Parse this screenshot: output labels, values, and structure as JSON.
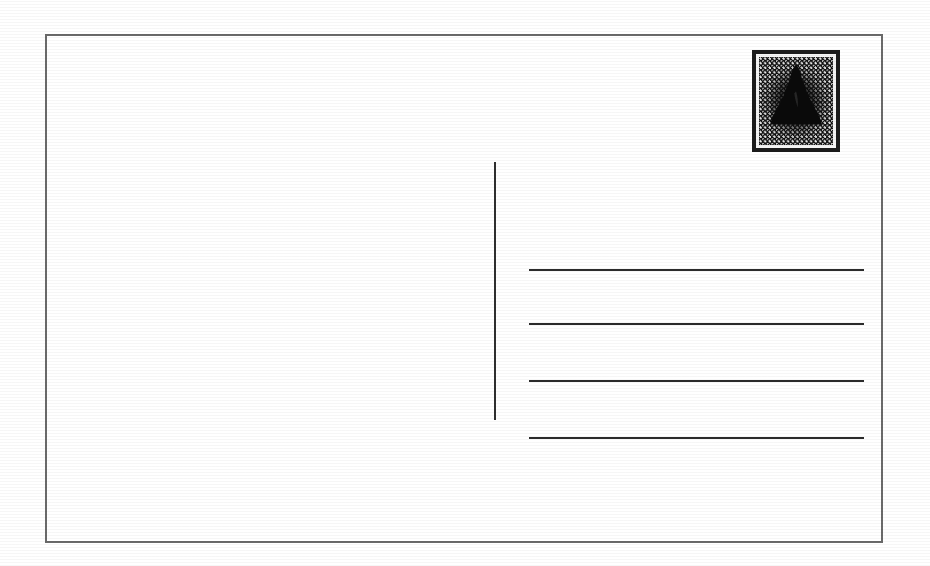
{
  "document": {
    "title": "Blank Postcard Back Template",
    "kind": "postcard-back",
    "orientation": "landscape",
    "background_color": "#ffffff",
    "ink_color": "#2a2a2a",
    "width_px": 930,
    "height_px": 566
  },
  "card": {
    "border_label": "Postcard outer border",
    "border_color": "#2a2a2a",
    "border_width_px": 2,
    "fill_color": "#ffffff",
    "left_px": 45,
    "top_px": 34,
    "width_px": 838,
    "height_px": 509
  },
  "divider": {
    "label": "Vertical divider between message area and address area",
    "color": "#2f2f2f",
    "x_px": 495,
    "top_px": 162,
    "bottom_px": 420,
    "thickness_px": 2
  },
  "message_area": {
    "label": "Message area",
    "content": "",
    "placeholder": ""
  },
  "address_area": {
    "label": "Address area",
    "line_color": "#2b2b2b",
    "line_thickness_px": 2,
    "line_left_px": 529,
    "line_right_px": 864,
    "lines": [
      {
        "index": 1,
        "label": "Address line 1",
        "value": "",
        "y_px": 270
      },
      {
        "index": 2,
        "label": "Address line 2",
        "value": "",
        "y_px": 324
      },
      {
        "index": 3,
        "label": "Address line 3",
        "value": "",
        "y_px": 381
      },
      {
        "index": 4,
        "label": "Address line 4",
        "value": "",
        "y_px": 438
      }
    ]
  },
  "stamp": {
    "label": "Postage stamp",
    "icon": "postage-stamp-icon",
    "subject": "dark conical tree silhouette on halftone dot field",
    "frame_color": "#1c1c1c",
    "inner_frame_color": "#f4f4f4",
    "field_color": "#101010",
    "dot_color": "#e8e8e8",
    "left_px": 752,
    "top_px": 50,
    "width_px": 88,
    "height_px": 102,
    "caption": ""
  }
}
